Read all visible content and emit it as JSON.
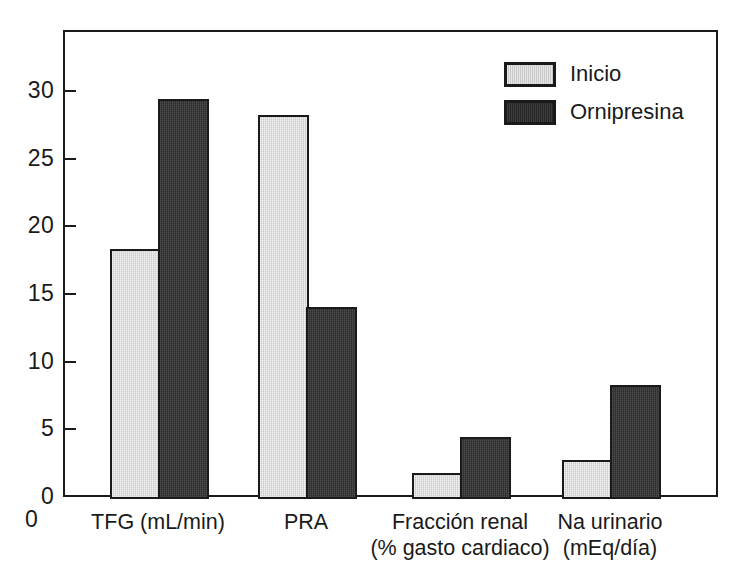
{
  "chart_data": {
    "type": "bar",
    "title": "",
    "subtitle": "",
    "xlabel": "",
    "ylabel": "",
    "categories": [
      "TFG (mL/min)",
      "PRA",
      "Fracción renal\n(% gasto cardiaco)",
      "Na urinario\n(mEq/día)"
    ],
    "category_lines": [
      [
        "TFG (mL/min)",
        ""
      ],
      [
        "PRA",
        ""
      ],
      [
        "Fracción renal",
        "(% gasto cardiaco)"
      ],
      [
        "Na urinario",
        "(mEq/día)"
      ]
    ],
    "series": [
      {
        "name": "Inicio",
        "color": "#c9c9c9",
        "values": [
          18.3,
          28.2,
          1.8,
          2.7
        ]
      },
      {
        "name": "Ornipresina",
        "color": "#2b2b2b",
        "values": [
          29.4,
          14.0,
          4.4,
          8.3
        ]
      }
    ],
    "yticks": [
      0,
      5,
      10,
      15,
      20,
      25,
      30
    ],
    "ytick_labels": [
      "0",
      "5",
      "10",
      "15",
      "20",
      "25",
      "30"
    ],
    "ylim": [
      0,
      34.5
    ],
    "grid": false,
    "legend_position": "top-right",
    "origin_label": "0",
    "axis_color": "#1a1a1a",
    "background_color": "#ffffff"
  },
  "legend": {
    "entries": [
      {
        "label": "Inicio",
        "swatch": "legend-swatch-inicio"
      },
      {
        "label": "Ornipresina",
        "swatch": "legend-swatch-ornipresina"
      }
    ]
  }
}
